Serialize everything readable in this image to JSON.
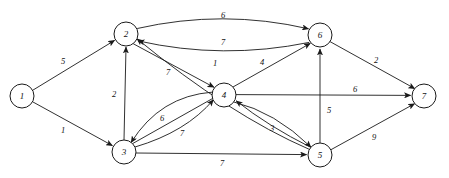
{
  "diagram": {
    "type": "directed-weighted-graph",
    "background_color": "#ffffff",
    "stroke_color": "#1a1a1a",
    "node_fill": "#ffffff",
    "nodes": [
      {
        "id": "1",
        "label": "1",
        "x": 22,
        "y": 96,
        "r": 12
      },
      {
        "id": "2",
        "label": "2",
        "x": 126,
        "y": 34,
        "r": 12
      },
      {
        "id": "3",
        "label": "3",
        "x": 124,
        "y": 152,
        "r": 12
      },
      {
        "id": "4",
        "label": "4",
        "x": 224,
        "y": 95,
        "r": 12
      },
      {
        "id": "5",
        "label": "5",
        "x": 320,
        "y": 155,
        "r": 12
      },
      {
        "id": "6",
        "label": "6",
        "x": 320,
        "y": 35,
        "r": 12
      },
      {
        "id": "7",
        "label": "7",
        "x": 424,
        "y": 96,
        "r": 12
      }
    ],
    "edges": [
      {
        "from": "1",
        "to": "2",
        "weight": "5",
        "label_x": 63,
        "label_y": 61,
        "shape": "straight"
      },
      {
        "from": "1",
        "to": "3",
        "weight": "1",
        "label_x": 63,
        "label_y": 130,
        "shape": "straight"
      },
      {
        "from": "2",
        "to": "6",
        "weight": "6",
        "label_x": 223,
        "label_y": 15,
        "shape": "curve-up"
      },
      {
        "from": "6",
        "to": "2",
        "weight": "7",
        "label_x": 223,
        "label_y": 42,
        "shape": "curve-down"
      },
      {
        "from": "3",
        "to": "2",
        "weight": "2",
        "label_x": 114,
        "label_y": 94,
        "shape": "straight"
      },
      {
        "from": "2",
        "to": "4",
        "weight": "7",
        "label_x": 168,
        "label_y": 72,
        "shape": "straight"
      },
      {
        "from": "5",
        "to": "2",
        "weight": "1",
        "label_x": 215,
        "label_y": 63,
        "shape": "curve"
      },
      {
        "from": "3",
        "to": "6",
        "weight": "4",
        "label_x": 262,
        "label_y": 62,
        "shape": "straight"
      },
      {
        "from": "4",
        "to": "3",
        "weight": "6",
        "label_x": 162,
        "label_y": 118,
        "shape": "curve-up"
      },
      {
        "from": "3",
        "to": "4",
        "weight": "7",
        "label_x": 182,
        "label_y": 133,
        "shape": "curve-down"
      },
      {
        "from": "4",
        "to": "7",
        "weight": "6",
        "label_x": 355,
        "label_y": 89,
        "shape": "straight"
      },
      {
        "from": "5",
        "to": "6",
        "weight": "5",
        "label_x": 329,
        "label_y": 110,
        "shape": "straight"
      },
      {
        "from": "4",
        "to": "5",
        "weight": "",
        "label_x": 0,
        "label_y": 0,
        "shape": "curve"
      },
      {
        "from": "5",
        "to": "4",
        "weight": "3",
        "label_x": 272,
        "label_y": 128,
        "shape": "curve"
      },
      {
        "from": "3",
        "to": "5",
        "weight": "7",
        "label_x": 222,
        "label_y": 163,
        "shape": "straight"
      },
      {
        "from": "6",
        "to": "7",
        "weight": "2",
        "label_x": 376,
        "label_y": 60,
        "shape": "straight"
      },
      {
        "from": "5",
        "to": "7",
        "weight": "9",
        "label_x": 374,
        "label_y": 137,
        "shape": "straight"
      }
    ]
  }
}
